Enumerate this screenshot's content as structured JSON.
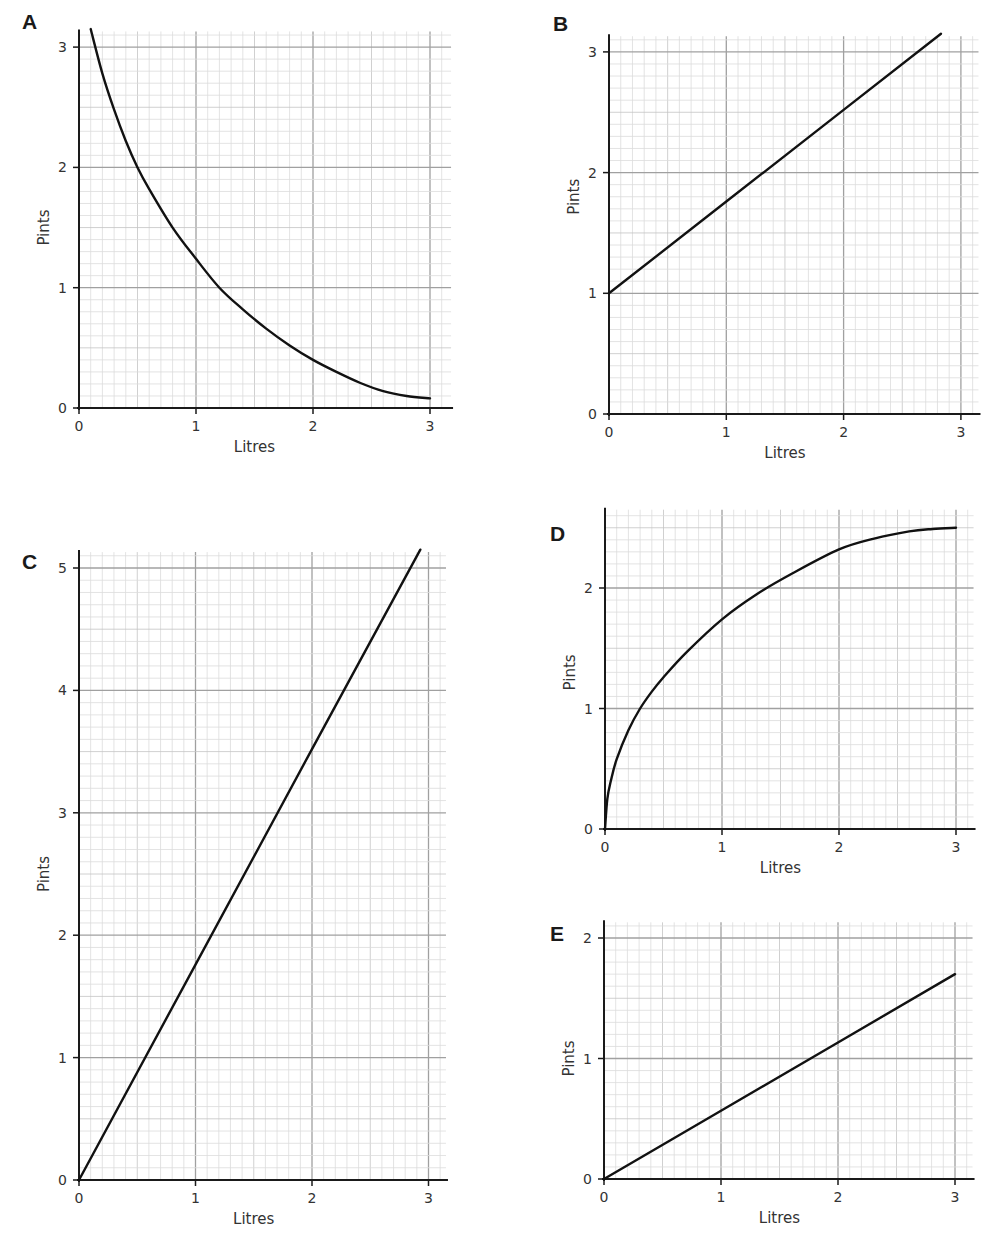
{
  "chart_data": [
    {
      "id": "A",
      "type": "line",
      "panel_label": "A",
      "xlabel": "Litres",
      "ylabel": "Pints",
      "xticks": [
        0,
        1,
        2,
        3
      ],
      "yticks": [
        0,
        1,
        2,
        3
      ],
      "xlim": [
        0,
        3.18
      ],
      "ylim": [
        0,
        3.13
      ],
      "grid": true,
      "minor_divisions": 10,
      "series": [
        {
          "name": "A",
          "shape": "decreasing curve",
          "x": [
            0.1,
            0.2,
            0.3,
            0.4,
            0.5,
            0.6,
            0.8,
            1.0,
            1.2,
            1.4,
            1.6,
            1.8,
            2.0,
            2.2,
            2.4,
            2.6,
            2.8,
            3.0
          ],
          "y": [
            3.15,
            2.78,
            2.48,
            2.22,
            2.0,
            1.82,
            1.5,
            1.24,
            1.0,
            0.82,
            0.66,
            0.52,
            0.4,
            0.3,
            0.21,
            0.14,
            0.1,
            0.08
          ]
        }
      ],
      "layout": {
        "origin": [
          79,
          408
        ],
        "px_x": 117,
        "px_y": 120.3,
        "panel_label_pos": [
          22,
          10
        ]
      }
    },
    {
      "id": "B",
      "type": "line",
      "panel_label": "B",
      "xlabel": "Litres",
      "ylabel": "Pints",
      "xticks": [
        0,
        1,
        2,
        3
      ],
      "yticks": [
        0,
        1,
        2,
        3
      ],
      "xlim": [
        0,
        3.15
      ],
      "ylim": [
        0,
        3.13
      ],
      "grid": true,
      "minor_divisions": 10,
      "series": [
        {
          "name": "B",
          "shape": "straight line, intercept 1",
          "x": [
            0,
            1,
            2,
            2.83
          ],
          "y": [
            1.0,
            1.76,
            2.52,
            3.15
          ]
        }
      ],
      "layout": {
        "origin": [
          609,
          414
        ],
        "px_x": 117.3,
        "px_y": 120.7,
        "panel_label_pos": [
          553,
          12
        ]
      }
    },
    {
      "id": "C",
      "type": "line",
      "panel_label": "C",
      "xlabel": "Litres",
      "ylabel": "Pints",
      "xticks": [
        0,
        1,
        2,
        3
      ],
      "yticks": [
        0,
        1,
        2,
        3,
        4,
        5
      ],
      "xlim": [
        0,
        3.15
      ],
      "ylim": [
        0,
        5.13
      ],
      "grid": true,
      "minor_divisions": 10,
      "series": [
        {
          "name": "C",
          "shape": "straight line through origin",
          "x": [
            0,
            1,
            2,
            2.93
          ],
          "y": [
            0,
            1.76,
            3.52,
            5.15
          ]
        }
      ],
      "layout": {
        "origin": [
          79,
          1180
        ],
        "px_x": 116.5,
        "px_y": 122.4,
        "panel_label_pos": [
          22,
          550
        ]
      }
    },
    {
      "id": "D",
      "type": "line",
      "panel_label": "D",
      "xlabel": "Litres",
      "ylabel": "Pints",
      "xticks": [
        0,
        1,
        2,
        3
      ],
      "yticks": [
        0,
        1,
        2
      ],
      "xlim": [
        0,
        3.15
      ],
      "ylim": [
        0,
        2.65
      ],
      "grid": true,
      "minor_divisions": 10,
      "series": [
        {
          "name": "D",
          "shape": "increasing concave curve",
          "x": [
            0,
            0.02,
            0.05,
            0.1,
            0.2,
            0.3,
            0.4,
            0.5,
            0.7,
            1.0,
            1.3,
            1.6,
            2.0,
            2.3,
            2.6,
            2.8,
            3.0
          ],
          "y": [
            0,
            0.25,
            0.4,
            0.58,
            0.82,
            1.0,
            1.14,
            1.26,
            1.47,
            1.74,
            1.95,
            2.12,
            2.32,
            2.41,
            2.47,
            2.49,
            2.5
          ]
        }
      ],
      "layout": {
        "origin": [
          605,
          829
        ],
        "px_x": 117,
        "px_y": 120.5,
        "panel_label_pos": [
          550,
          522
        ]
      }
    },
    {
      "id": "E",
      "type": "line",
      "panel_label": "E",
      "xlabel": "Litres",
      "ylabel": "Pints",
      "xticks": [
        0,
        1,
        2,
        3
      ],
      "yticks": [
        0,
        1,
        2
      ],
      "xlim": [
        0,
        3.15
      ],
      "ylim": [
        0,
        2.13
      ],
      "grid": true,
      "minor_divisions": 10,
      "series": [
        {
          "name": "E",
          "shape": "straight line through origin",
          "x": [
            0,
            1,
            2,
            3
          ],
          "y": [
            0,
            0.567,
            1.133,
            1.7
          ]
        }
      ],
      "layout": {
        "origin": [
          604,
          1179
        ],
        "px_x": 117,
        "px_y": 120.5,
        "panel_label_pos": [
          550,
          922
        ]
      }
    }
  ],
  "style": {
    "major_grid_color": "#a0a0a0",
    "half_grid_color": "#c4c4c4",
    "minor_grid_color": "#dcdcdc",
    "axis_color": "#1a1a1a",
    "curve_color": "#111111"
  }
}
